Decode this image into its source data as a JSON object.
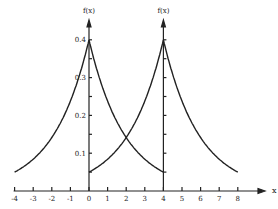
{
  "chart_data": {
    "type": "line",
    "title": "",
    "xlabel": "x",
    "ylabel": "f(x)",
    "xlim": [
      -4,
      8.5
    ],
    "ylim": [
      0,
      0.42
    ],
    "grid": false,
    "x_ticks": [
      "-4",
      "-3",
      "-2",
      "-1",
      "0",
      "1",
      "2",
      "3",
      "4",
      "5",
      "6",
      "7",
      "8"
    ],
    "y_ticks": [
      "0.1",
      "0.2",
      "0.3",
      "0.4"
    ],
    "vertical_axes_at": [
      0,
      4
    ],
    "axis_labels_top": [
      "f(x)",
      "f(x)"
    ],
    "series": [
      {
        "name": "density centered at 0",
        "center": 0,
        "x": [
          -4,
          -3,
          -2,
          -1,
          0,
          1,
          2,
          3,
          4
        ],
        "values": [
          0.05,
          0.084,
          0.141,
          0.238,
          0.4,
          0.238,
          0.141,
          0.084,
          0.05
        ]
      },
      {
        "name": "density centered at 4",
        "center": 4,
        "x": [
          0,
          1,
          2,
          3,
          4,
          5,
          6,
          7,
          8
        ],
        "values": [
          0.05,
          0.084,
          0.141,
          0.238,
          0.4,
          0.238,
          0.141,
          0.084,
          0.05
        ]
      }
    ],
    "annotations": [
      {
        "text": "intersection",
        "x": 2,
        "y": 0.141
      }
    ]
  }
}
